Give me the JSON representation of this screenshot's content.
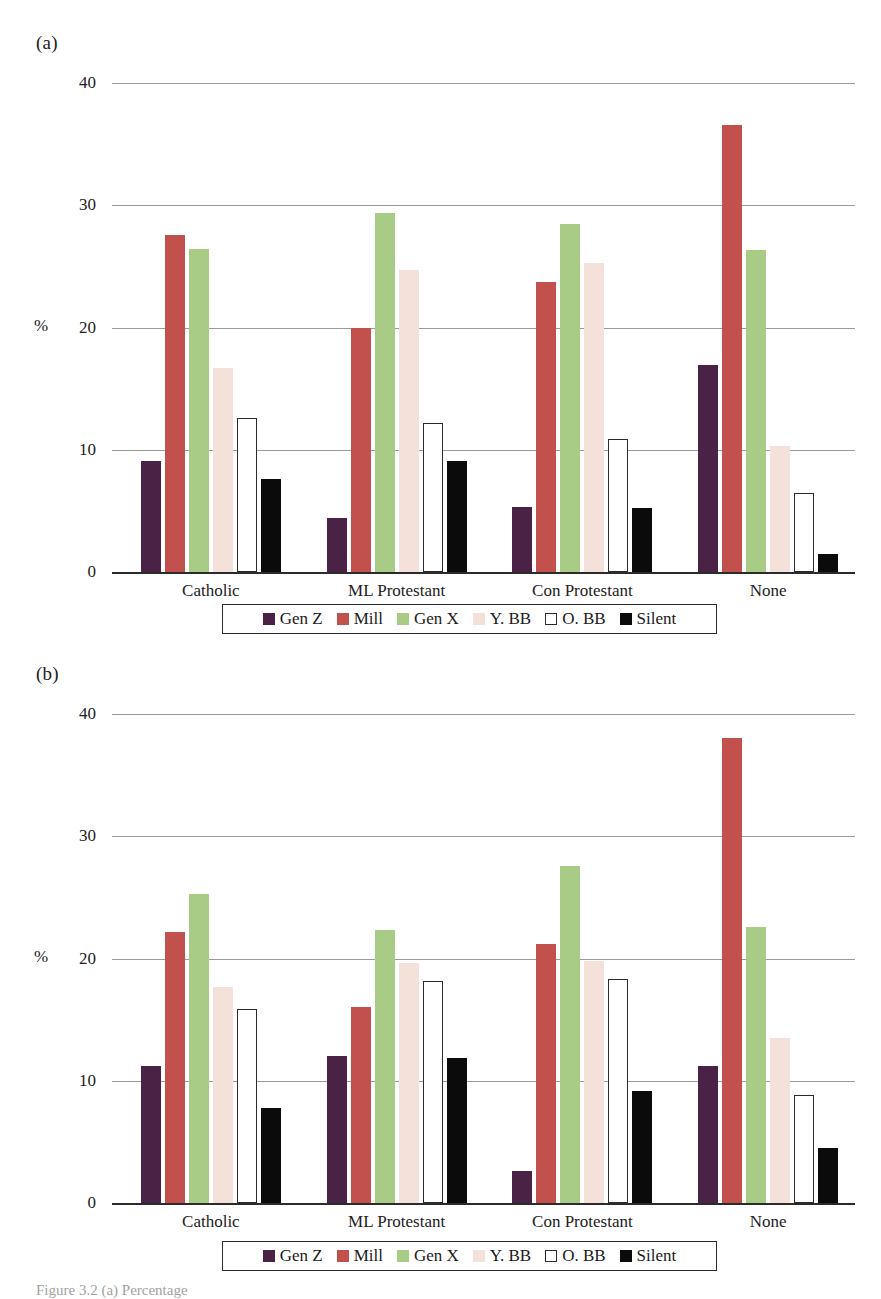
{
  "figure": {
    "panel_a_tag": "(a)",
    "panel_b_tag": "(b)",
    "caption": "Figure 3.2  (a) Percentage"
  },
  "legend": {
    "items": [
      {
        "label": "Gen Z",
        "color": "#4a2246",
        "outlined": false
      },
      {
        "label": "Mill",
        "color": "#c2504c",
        "outlined": false
      },
      {
        "label": "Gen X",
        "color": "#a8cc86",
        "outlined": false
      },
      {
        "label": "Y. BB",
        "color": "#f4e2da",
        "outlined": false
      },
      {
        "label": "O. BB",
        "color": "#ffffff",
        "outlined": true
      },
      {
        "label": "Silent",
        "color": "#0b0b0b",
        "outlined": false
      }
    ]
  },
  "axis": {
    "y_title": "%",
    "y_ticks": [
      "0",
      "10",
      "20",
      "30",
      "40"
    ],
    "y_tick_values": [
      0,
      10,
      20,
      30,
      40
    ],
    "y_min": 0,
    "y_max": 40,
    "x_categories": [
      "Catholic",
      "ML Protestant",
      "Con Protestant",
      "None"
    ]
  },
  "chart_data": [
    {
      "type": "bar",
      "title": "(a)",
      "xlabel": "",
      "ylabel": "%",
      "ylim": [
        0,
        40
      ],
      "grid": true,
      "legend_position": "bottom",
      "categories": [
        "Catholic",
        "ML Protestant",
        "Con Protestant",
        "None"
      ],
      "series": [
        {
          "name": "Gen Z",
          "color": "#4a2246",
          "values": [
            9.1,
            4.4,
            5.3,
            16.9
          ]
        },
        {
          "name": "Mill",
          "color": "#c2504c",
          "values": [
            27.6,
            20.0,
            23.7,
            36.6
          ]
        },
        {
          "name": "Gen X",
          "color": "#a8cc86",
          "values": [
            26.4,
            29.4,
            28.5,
            26.3
          ]
        },
        {
          "name": "Y. BB",
          "color": "#f4e2da",
          "values": [
            16.7,
            24.7,
            25.3,
            10.3
          ]
        },
        {
          "name": "O. BB",
          "color": "#ffffff",
          "values": [
            12.6,
            12.2,
            10.9,
            6.5
          ]
        },
        {
          "name": "Silent",
          "color": "#0b0b0b",
          "values": [
            7.6,
            9.1,
            5.2,
            1.5
          ]
        }
      ]
    },
    {
      "type": "bar",
      "title": "(b)",
      "xlabel": "",
      "ylabel": "%",
      "ylim": [
        0,
        40
      ],
      "grid": true,
      "legend_position": "bottom",
      "categories": [
        "Catholic",
        "ML Protestant",
        "Con Protestant",
        "None"
      ],
      "series": [
        {
          "name": "Gen Z",
          "color": "#4a2246",
          "values": [
            11.2,
            12.0,
            2.6,
            11.2
          ]
        },
        {
          "name": "Mill",
          "color": "#c2504c",
          "values": [
            22.2,
            16.0,
            21.2,
            38.0
          ]
        },
        {
          "name": "Gen X",
          "color": "#a8cc86",
          "values": [
            25.3,
            22.3,
            27.6,
            22.6
          ]
        },
        {
          "name": "Y. BB",
          "color": "#f4e2da",
          "values": [
            17.7,
            19.6,
            19.8,
            13.5
          ]
        },
        {
          "name": "O. BB",
          "color": "#ffffff",
          "values": [
            15.9,
            18.2,
            18.3,
            8.8
          ]
        },
        {
          "name": "Silent",
          "color": "#0b0b0b",
          "values": [
            7.8,
            11.9,
            9.2,
            4.5
          ]
        }
      ]
    }
  ]
}
